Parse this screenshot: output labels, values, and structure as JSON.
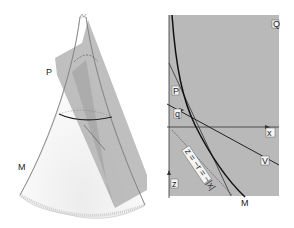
{
  "left_figure": {
    "description": "3D cone with intersecting plane",
    "labels": {
      "plane": "P",
      "cone": "M"
    }
  },
  "right_figure": {
    "description": "2D cross-section diagram",
    "labels": {
      "region": "Q",
      "plane_line": "P",
      "point": "q",
      "x_axis": "x",
      "line_v": "V",
      "z_axis": "z",
      "curve": "M",
      "equation": "z = −r = −|x|"
    }
  },
  "colors": {
    "panel_gray": "#b9b9b9",
    "plane_gray": "#a8a8a8",
    "line": "#222222"
  }
}
